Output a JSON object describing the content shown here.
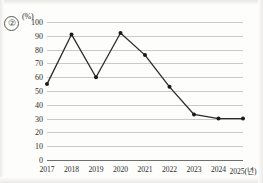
{
  "figure": {
    "item_number": "②",
    "unit_label": "(%)"
  },
  "chart_data": {
    "type": "line",
    "title": "",
    "subtitle": "",
    "xlabel": "(년)",
    "ylabel": "(%)",
    "categories": [
      "2017",
      "2018",
      "2019",
      "2020",
      "2021",
      "2022",
      "2023",
      "2024",
      "2025"
    ],
    "x_tick_labels": [
      "2017",
      "2018",
      "2019",
      "2020",
      "2021",
      "2022",
      "2023",
      "2024",
      "2025(년)"
    ],
    "values": [
      55,
      91,
      60,
      92,
      76,
      53,
      33,
      30,
      30
    ],
    "series": [
      {
        "name": "",
        "values": [
          55,
          91,
          60,
          92,
          76,
          53,
          33,
          30,
          30
        ],
        "color": "#2b2b2b",
        "marker": "circle"
      }
    ],
    "ylim": [
      0,
      100
    ],
    "y_ticks": [
      100,
      90,
      80,
      70,
      60,
      50,
      40,
      30,
      20,
      10,
      0
    ],
    "y_tick_labels": [
      "100",
      "90",
      "80",
      "70",
      "60",
      "50",
      "40",
      "30",
      "20",
      "10",
      "0"
    ],
    "grid": true,
    "grid_axis": "y",
    "legend": false,
    "legend_position": "none",
    "annotations": []
  },
  "colors": {
    "line": "#2b2b2b",
    "marker": "#1a1a1a",
    "grid": "#c9c9c9",
    "axis": "#6f6f6f",
    "text": "#2b2b2b",
    "background": "#fdfdfc"
  }
}
